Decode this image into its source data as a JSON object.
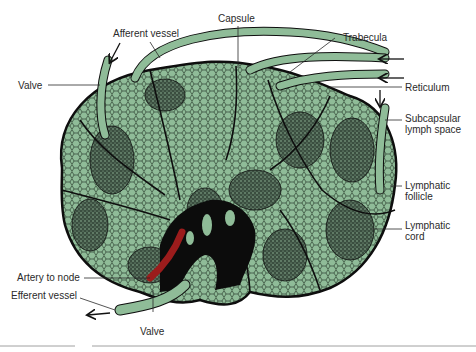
{
  "diagram": {
    "colors": {
      "tissue": "#8fbc98",
      "tissue_dark": "#6f9f7a",
      "outline": "#101010",
      "artery": "#9b1c1c",
      "label_text": "#2a2a2a"
    },
    "labels": {
      "capsule": "Capsule",
      "afferent_vessel": "Afferent vessel",
      "trabecula": "Trabecula",
      "valve_left": "Valve",
      "reticulum": "Reticulum",
      "subcapsular_1": "Subcapsular",
      "subcapsular_2": "lymph space",
      "follicle_1": "Lymphatic",
      "follicle_2": "follicle",
      "cord_1": "Lymphatic",
      "cord_2": "cord",
      "artery": "Artery to node",
      "efferent_vessel": "Efferent vessel",
      "valve_bottom": "Valve"
    },
    "icons": [
      "flow-arrow-icon"
    ]
  }
}
